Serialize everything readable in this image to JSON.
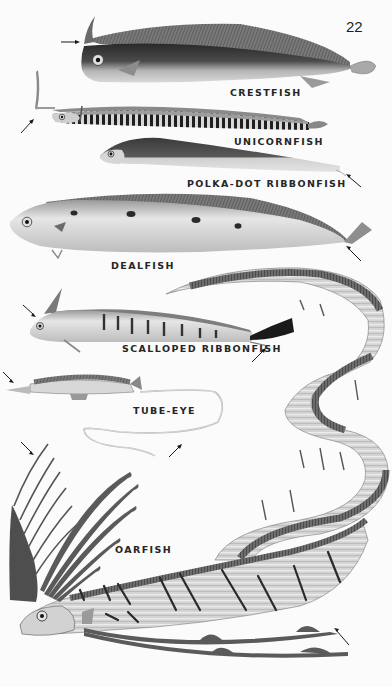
{
  "page": {
    "number": "22",
    "background": "#fbfbfb",
    "ink_color": "#262626"
  },
  "species": [
    {
      "name": "CRESTFISH",
      "label_pos": [
        230,
        87
      ]
    },
    {
      "name": "UNICORNFISH",
      "label_pos": [
        234,
        136
      ]
    },
    {
      "name": "POLKA-DOT RIBBONFISH",
      "label_pos": [
        187,
        178
      ]
    },
    {
      "name": "DEALFISH",
      "label_pos": [
        111,
        260
      ]
    },
    {
      "name": "SCALLOPED RIBBONFISH",
      "label_pos": [
        122,
        343
      ]
    },
    {
      "name": "TUBE-EYE",
      "label_pos": [
        133,
        405
      ]
    },
    {
      "name": "OARFISH",
      "label_pos": [
        115,
        544
      ]
    }
  ]
}
